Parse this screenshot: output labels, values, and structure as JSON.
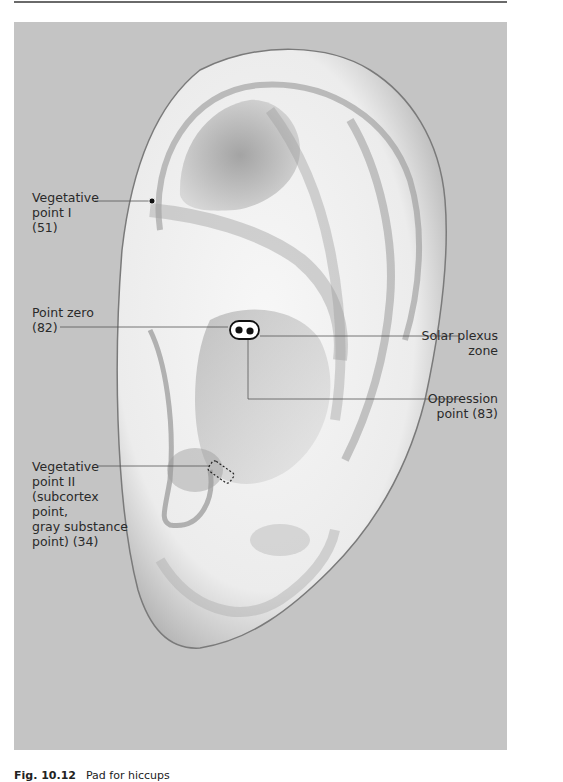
{
  "figure": {
    "background_color": "#c4c4c4",
    "labels": [
      {
        "id": "vegetative-point-1",
        "text": "Vegetative\npoint I\n(51)"
      },
      {
        "id": "point-zero",
        "text": "Point zero\n(82)"
      },
      {
        "id": "solar-plexus-zone",
        "text": "Solar plexus\nzone"
      },
      {
        "id": "oppression-point",
        "text": "Oppression\npoint (83)"
      },
      {
        "id": "vegetative-point-2",
        "text": "Vegetative\npoint II\n(subcortex\npoint,\ngray substance\npoint) (34)"
      }
    ]
  },
  "caption": {
    "figure_number": "Fig. 10.12",
    "text": "Pad for hiccups"
  }
}
